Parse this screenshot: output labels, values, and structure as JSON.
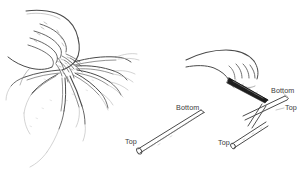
{
  "figure": {
    "type": "line-drawing",
    "background_color": "#ffffff",
    "ink_color": "#3b3b3b",
    "width": 307,
    "height": 188
  },
  "panels": {
    "left": {
      "name": "hand-holding-root-clump",
      "description": "hand grasping a crown of fleshy roots radiating outward"
    },
    "middle": {
      "name": "single-root-cutting",
      "description": "detached tapered root cutting shown at an angle",
      "labels": {
        "bottom": "Bottom",
        "top": "Top"
      }
    },
    "right": {
      "name": "hand-with-knife-cutting-root",
      "description": "hand holding a knife making a cut across a root",
      "labels": {
        "bottom": "Bottom",
        "top": "Top",
        "top_secondary": "Top"
      }
    }
  },
  "colors": {
    "ink": "#3b3b3b",
    "ink_light": "#8a8a8a",
    "ink_faint": "#b4b4b4",
    "blade_dark": "#1a1a1a",
    "paper": "#ffffff"
  }
}
